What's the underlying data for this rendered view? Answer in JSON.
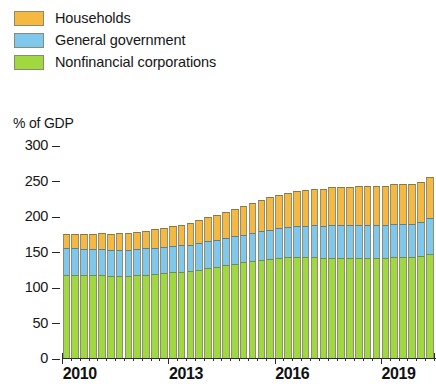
{
  "legend": {
    "position": "top-left",
    "items": [
      {
        "label": "Households",
        "color": "#f5b942",
        "icon": "legend-swatch"
      },
      {
        "label": "General government",
        "color": "#7ec8ee",
        "icon": "legend-swatch"
      },
      {
        "label": "Nonfinancial corporations",
        "color": "#9fd93f",
        "icon": "legend-swatch"
      }
    ]
  },
  "axis": {
    "y_title": "% of GDP",
    "y_ticks": [
      "300",
      "250",
      "200",
      "150",
      "100",
      "50",
      "0"
    ],
    "x_labels": [
      "2010",
      "2013",
      "2016",
      "2019"
    ]
  },
  "chart_data": {
    "type": "bar",
    "stacked": true,
    "title": "",
    "subtitle": "",
    "xlabel": "",
    "ylabel": "% of GDP",
    "ylim": [
      0,
      300
    ],
    "ytick_step": 50,
    "grid": false,
    "legend_position": "top-left",
    "x_tick_labels": [
      "2010",
      "2013",
      "2016",
      "2019"
    ],
    "x_tick_index": [
      0,
      12,
      24,
      36
    ],
    "categories": [
      "2010Q1",
      "2010Q2",
      "2010Q3",
      "2010Q4",
      "2011Q1",
      "2011Q2",
      "2011Q3",
      "2011Q4",
      "2012Q1",
      "2012Q2",
      "2012Q3",
      "2012Q4",
      "2013Q1",
      "2013Q2",
      "2013Q3",
      "2013Q4",
      "2014Q1",
      "2014Q2",
      "2014Q3",
      "2014Q4",
      "2015Q1",
      "2015Q2",
      "2015Q3",
      "2015Q4",
      "2016Q1",
      "2016Q2",
      "2016Q3",
      "2016Q4",
      "2017Q1",
      "2017Q2",
      "2017Q3",
      "2017Q4",
      "2018Q1",
      "2018Q2",
      "2018Q3",
      "2018Q4",
      "2019Q1",
      "2019Q2",
      "2019Q3",
      "2019Q4",
      "2020Q1",
      "2020Q2"
    ],
    "series": [
      {
        "name": "Nonfinancial corporations",
        "color": "#9fd93f",
        "values": [
          119,
          119,
          118,
          118,
          118,
          117,
          117,
          117,
          118,
          119,
          120,
          121,
          122,
          123,
          124,
          126,
          128,
          130,
          132,
          134,
          136,
          138,
          140,
          141,
          142,
          143,
          143,
          143,
          143,
          142,
          142,
          142,
          142,
          142,
          142,
          142,
          142,
          143,
          143,
          143,
          145,
          148
        ]
      },
      {
        "name": "General government",
        "color": "#7ec8ee",
        "values": [
          37,
          37,
          37,
          37,
          37,
          37,
          37,
          37,
          37,
          37,
          37,
          37,
          37,
          37,
          37,
          38,
          38,
          38,
          38,
          39,
          39,
          40,
          40,
          41,
          42,
          43,
          44,
          45,
          46,
          46,
          47,
          47,
          47,
          47,
          47,
          47,
          47,
          47,
          47,
          47,
          48,
          50
        ]
      },
      {
        "name": "Households",
        "color": "#f5b942",
        "values": [
          20,
          20,
          21,
          21,
          22,
          22,
          23,
          23,
          24,
          25,
          26,
          27,
          28,
          29,
          31,
          32,
          34,
          35,
          37,
          38,
          40,
          42,
          44,
          46,
          47,
          48,
          49,
          50,
          51,
          52,
          53,
          54,
          54,
          55,
          55,
          55,
          55,
          56,
          56,
          56,
          57,
          58
        ]
      }
    ],
    "totals": [
      176,
      176,
      176,
      176,
      177,
      176,
      177,
      177,
      179,
      181,
      183,
      185,
      187,
      189,
      192,
      196,
      200,
      203,
      207,
      211,
      215,
      220,
      224,
      228,
      231,
      234,
      236,
      238,
      240,
      240,
      242,
      243,
      243,
      244,
      244,
      244,
      244,
      246,
      246,
      246,
      250,
      256
    ]
  }
}
